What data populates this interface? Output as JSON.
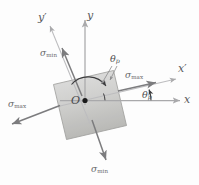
{
  "figure": {
    "canvas": {
      "width": 199,
      "height": 185,
      "background": "#fdfdfd"
    },
    "origin_label": "O",
    "axes": [
      {
        "name": "x-axis",
        "label": "x",
        "prime": false,
        "angle_deg": 0
      },
      {
        "name": "y-axis",
        "label": "y",
        "prime": false,
        "angle_deg": 90
      },
      {
        "name": "x-prime-axis",
        "label": "x",
        "prime": true,
        "angle_deg": 13
      },
      {
        "name": "y-prime-axis",
        "label": "y",
        "prime": true,
        "angle_deg": 103
      }
    ],
    "stress_labels": [
      {
        "name": "sigma-max-right",
        "symbol": "σ",
        "subscript": "max"
      },
      {
        "name": "sigma-max-left",
        "symbol": "σ",
        "subscript": "max"
      },
      {
        "name": "sigma-min-upper",
        "symbol": "σ",
        "subscript": "min"
      },
      {
        "name": "sigma-min-lower",
        "symbol": "σ",
        "subscript": "min"
      }
    ],
    "angle_labels": [
      {
        "name": "theta-p-upper",
        "symbol": "θ",
        "subscript": "p"
      },
      {
        "name": "theta-p-lower",
        "symbol": "θ",
        "subscript": "p"
      }
    ],
    "element": {
      "name": "stress-element-square",
      "rotation_deg": 13,
      "fill_top": "#d8d8d6",
      "fill_bottom": "#b9b9b6",
      "stroke": "#8e8e8c"
    },
    "colors": {
      "axis_line": "#a9a9ab",
      "stress_arrow": "#7c7c7e",
      "arc": "#3c3c3e",
      "origin_dot": "#1a1a1a",
      "text": "#6e6e70"
    },
    "symbols": {
      "sigma": "σ",
      "theta": "θ",
      "prime": "′",
      "sub_max": "max",
      "sub_min": "min",
      "sub_p": "p"
    }
  }
}
